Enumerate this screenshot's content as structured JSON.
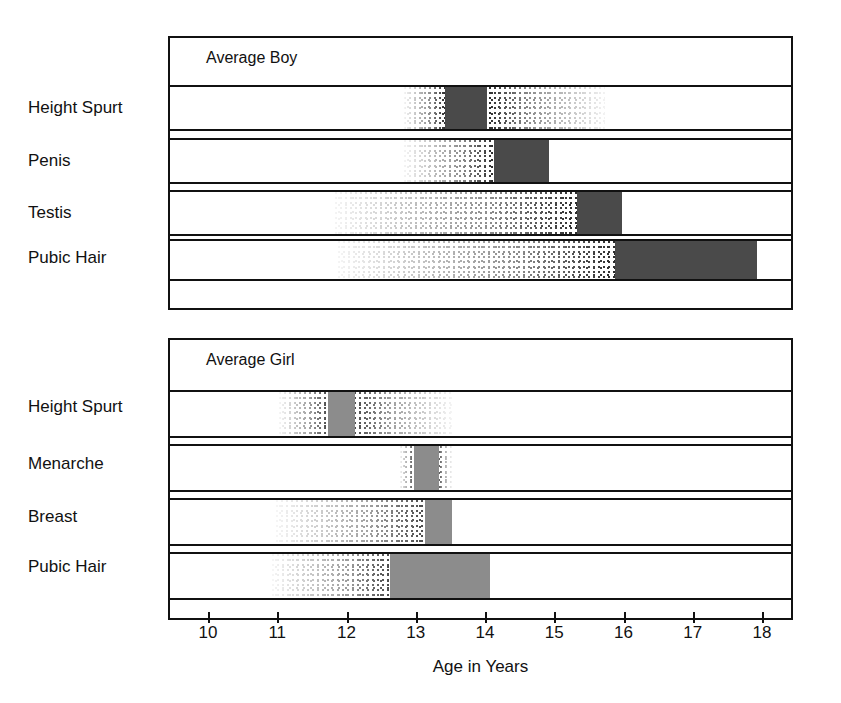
{
  "figure": {
    "axis_title": "Age in Years",
    "tick_labels": [
      "10",
      "11",
      "12",
      "13",
      "14",
      "15",
      "16",
      "17",
      "18"
    ],
    "panels": [
      {
        "id": "boy",
        "title": "Average Boy"
      },
      {
        "id": "girl",
        "title": "Average Girl"
      }
    ]
  },
  "labels": {
    "boy": [
      "Height Spurt",
      "Penis",
      "Testis",
      "Pubic Hair"
    ],
    "girl": [
      "Height Spurt",
      "Menarche",
      "Breast",
      "Pubic Hair"
    ]
  },
  "colors": {
    "ink": "#111111",
    "boy_solid": "#4a4a4a",
    "girl_solid": "#8c8c8c",
    "stipple": "#2b2b2b",
    "background": "#ffffff"
  },
  "chart_data": {
    "type": "bar",
    "subtitle": "Average Boy / Average Girl",
    "xlabel": "Age in Years",
    "ylabel": "",
    "xlim": [
      9.7,
      18.4
    ],
    "xticks": [
      10,
      11,
      12,
      13,
      14,
      15,
      16,
      17,
      18
    ],
    "grid": false,
    "legend": "none",
    "orientation": "horizontal",
    "note": "Each bar is a stippled range (onset-to-completion spread) with a solid block marking the typical/peak interval.",
    "panels": [
      {
        "name": "Average Boy",
        "solid_color": "#4a4a4a",
        "rows": [
          {
            "label": "Height Spurt",
            "range_start": 12.8,
            "range_end": 15.7,
            "solid_start": 13.4,
            "solid_end": 14.0
          },
          {
            "label": "Penis",
            "range_start": 12.8,
            "range_end": 14.9,
            "solid_start": 14.1,
            "solid_end": 14.9
          },
          {
            "label": "Testis",
            "range_start": 11.8,
            "range_end": 15.95,
            "solid_start": 15.3,
            "solid_end": 15.95
          },
          {
            "label": "Pubic Hair",
            "range_start": 11.85,
            "range_end": 17.9,
            "solid_start": 15.85,
            "solid_end": 17.9
          }
        ]
      },
      {
        "name": "Average Girl",
        "solid_color": "#8c8c8c",
        "rows": [
          {
            "label": "Height Spurt",
            "range_start": 11.0,
            "range_end": 13.5,
            "solid_start": 11.7,
            "solid_end": 12.1
          },
          {
            "label": "Menarche",
            "range_start": 12.75,
            "range_end": 13.5,
            "solid_start": 12.95,
            "solid_end": 13.3
          },
          {
            "label": "Breast",
            "range_start": 10.95,
            "range_end": 13.5,
            "solid_start": 13.1,
            "solid_end": 13.5
          },
          {
            "label": "Pubic Hair",
            "range_start": 10.9,
            "range_end": 14.05,
            "solid_start": 12.6,
            "solid_end": 14.05
          }
        ]
      }
    ]
  }
}
